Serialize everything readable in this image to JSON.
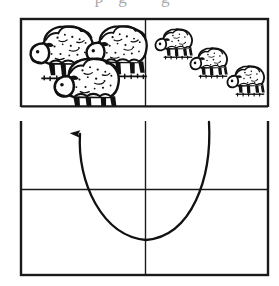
{
  "figure": {
    "title": "",
    "cut_off_caption_fragment": "pg g",
    "style": "black-and-white line drawing / woodcut engraving",
    "canvas": {
      "width": 279,
      "height": 286,
      "background": "#ffffff"
    },
    "ink_color": "#1a1a1a",
    "grid": {
      "label": "four-panel box",
      "left": 21,
      "right": 268,
      "top": 19,
      "bottom": 275,
      "vertical_divider_x": 145,
      "horizontal_divider_y": [
        106,
        189
      ],
      "border_width": 2,
      "inner_line_width": 1.3
    },
    "panels": [
      {
        "name": "top-left-panel",
        "position": "top-left",
        "content_label": "flock of three large sheep (near / foreground)",
        "sheep_count": 3,
        "sheep_scale": "large"
      },
      {
        "name": "top-right-panel",
        "position": "top-right",
        "content_label": "three small sheep spread apart (far / background)",
        "sheep_count": 3,
        "sheep_scale": "small"
      },
      {
        "name": "middle-left-panel",
        "position": "middle-left",
        "content_label": "empty",
        "sheep_count": 0
      },
      {
        "name": "middle-right-panel",
        "position": "middle-right",
        "content_label": "empty",
        "sheep_count": 0
      },
      {
        "name": "bottom-left-panel",
        "position": "bottom-left",
        "content_label": "empty",
        "sheep_count": 0
      },
      {
        "name": "bottom-right-panel",
        "position": "bottom-right",
        "content_label": "empty",
        "sheep_count": 0
      }
    ],
    "arrow": {
      "name": "u-shaped-curved-arrow",
      "shape": "U-curve (parabola opening upward)",
      "direction": "right-to-left, head pointing up",
      "tail_point": {
        "x": 209,
        "y": 122
      },
      "bottom_point": {
        "x": 146,
        "y": 240
      },
      "head_point": {
        "x": 80,
        "y": 123
      },
      "head_type": "solid narrow triangle",
      "stroke_width": 2.2
    },
    "sheep_large": [
      {
        "id": "sheep-large-1",
        "x": 26,
        "y": 22,
        "w": 62,
        "h": 52
      },
      {
        "id": "sheep-large-2",
        "x": 84,
        "y": 22,
        "w": 60,
        "h": 52
      },
      {
        "id": "sheep-large-3",
        "x": 50,
        "y": 56,
        "w": 62,
        "h": 50
      }
    ],
    "sheep_small": [
      {
        "id": "sheep-small-1",
        "x": 151,
        "y": 26,
        "w": 38,
        "h": 30
      },
      {
        "id": "sheep-small-2",
        "x": 186,
        "y": 46,
        "w": 38,
        "h": 30
      },
      {
        "id": "sheep-small-3",
        "x": 223,
        "y": 64,
        "w": 38,
        "h": 30
      }
    ]
  }
}
